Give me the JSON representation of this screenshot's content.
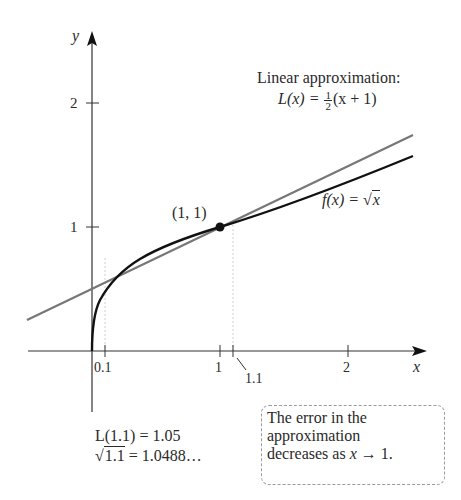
{
  "figure": {
    "axes": {
      "x_label": "x",
      "y_label": "y",
      "x_ticks": [
        "0.1",
        "1",
        "1.1",
        "2"
      ],
      "y_ticks": [
        "1",
        "2"
      ]
    },
    "point_label": "(1, 1)",
    "linear_title": "Linear approximation:",
    "linear_lhs": "L(x) =",
    "linear_frac_num": "1",
    "linear_frac_den": "2",
    "linear_rhs": "(x + 1)",
    "func_lhs": "f(x) =",
    "func_sqrt_sym": "√",
    "func_sqrt_arg": "x",
    "calc_line1": "L(1.1) = 1.05",
    "calc_sqrt_sym": "√",
    "calc_sqrt_arg": "1.1",
    "calc_line2_rest": " = 1.0488…",
    "note_line1": "The error in the",
    "note_line2": "approximation",
    "note_line3_pre": "decreases as ",
    "note_line3_var": "x",
    "note_line3_post": " → 1.",
    "colors": {
      "curve": "#111111",
      "tangent": "#777777",
      "axes": "#333333",
      "guide": "#cccccc"
    }
  }
}
